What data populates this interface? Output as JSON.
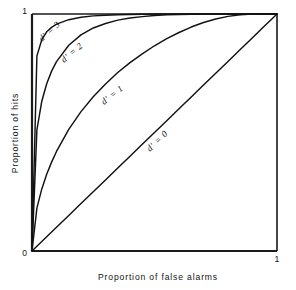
{
  "figure": {
    "title": "",
    "axes": {
      "x_label": "Proportion of false alarms",
      "y_label": "Proportion of hits",
      "x_ticks": [
        "0",
        "1"
      ],
      "y_ticks": [
        "0",
        "1"
      ]
    },
    "labels": {
      "d3": "d' = 3",
      "d2": "d' = 2",
      "d1": "d' = 1",
      "d0": "d' = 0"
    },
    "colors": {
      "curve": "#121212",
      "frame": "#1a1a1a",
      "text": "#141414",
      "background": "#ffffff"
    }
  },
  "chart_data": {
    "type": "line",
    "title": "",
    "subtitle": "",
    "xlabel": "Proportion of false alarms",
    "ylabel": "Proportion of hits",
    "xlim": [
      0,
      1
    ],
    "ylim": [
      0,
      1
    ],
    "xticks": [
      0,
      1
    ],
    "yticks": [
      0,
      1
    ],
    "xticklabels": [
      "0",
      "1"
    ],
    "yticklabels": [
      "0",
      "1"
    ],
    "grid": false,
    "legend": "inline-annotations",
    "annotations": [
      {
        "text": "d' = 3",
        "x": 0.08,
        "y": 0.86
      },
      {
        "text": "d' = 2",
        "x": 0.17,
        "y": 0.72
      },
      {
        "text": "d' = 1",
        "x": 0.33,
        "y": 0.55
      },
      {
        "text": "d' = 0",
        "x": 0.6,
        "y": 0.58
      }
    ],
    "x": [
      0.0,
      0.02,
      0.04,
      0.06,
      0.08,
      0.1,
      0.15,
      0.2,
      0.25,
      0.3,
      0.35,
      0.4,
      0.45,
      0.5,
      0.55,
      0.6,
      0.65,
      0.7,
      0.75,
      0.8,
      0.85,
      0.9,
      0.95,
      0.98,
      1.0
    ],
    "series": [
      {
        "name": "d' = 0",
        "d_prime": 0,
        "values": [
          0.0,
          0.02,
          0.04,
          0.06,
          0.08,
          0.1,
          0.15,
          0.2,
          0.25,
          0.3,
          0.35,
          0.4,
          0.45,
          0.5,
          0.55,
          0.6,
          0.65,
          0.7,
          0.75,
          0.8,
          0.85,
          0.9,
          0.95,
          0.98,
          1.0
        ]
      },
      {
        "name": "d' = 1",
        "d_prime": 1,
        "values": [
          0.0,
          0.181,
          0.262,
          0.324,
          0.375,
          0.42,
          0.513,
          0.588,
          0.651,
          0.705,
          0.753,
          0.795,
          0.832,
          0.866,
          0.896,
          0.922,
          0.945,
          0.964,
          0.979,
          0.99,
          0.997,
          1.0,
          1.0,
          1.0,
          1.0
        ]
      },
      {
        "name": "d' = 2",
        "d_prime": 2,
        "values": [
          0.0,
          0.511,
          0.632,
          0.706,
          0.759,
          0.799,
          0.868,
          0.912,
          0.941,
          0.96,
          0.974,
          0.983,
          0.989,
          0.994,
          0.997,
          0.998,
          0.999,
          1.0,
          1.0,
          1.0,
          1.0,
          1.0,
          1.0,
          1.0,
          1.0
        ]
      },
      {
        "name": "d' = 3",
        "d_prime": 3,
        "values": [
          0.0,
          0.823,
          0.892,
          0.925,
          0.944,
          0.957,
          0.976,
          0.986,
          0.992,
          0.995,
          0.997,
          0.998,
          0.999,
          1.0,
          1.0,
          1.0,
          1.0,
          1.0,
          1.0,
          1.0,
          1.0,
          1.0,
          1.0,
          1.0,
          1.0
        ]
      }
    ]
  }
}
